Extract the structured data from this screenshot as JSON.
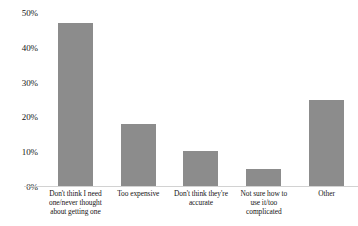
{
  "chart_data": {
    "type": "bar",
    "title": "",
    "subtitle": "",
    "xlabel": "",
    "ylabel": "",
    "categories": [
      "Don't think I need one/never thought about getting one",
      "Too expensive",
      "Don't think they're accurate",
      "Not sure how to use it/too complicated",
      "Other"
    ],
    "category_lines": [
      [
        "Don't think I need",
        "one/never thought",
        "about getting one"
      ],
      [
        "Too expensive"
      ],
      [
        "Don't think they're",
        "accurate"
      ],
      [
        "Not sure how to",
        "use it/too",
        "complicated"
      ],
      [
        "Other"
      ]
    ],
    "values": [
      47,
      18,
      10,
      5,
      25
    ],
    "value_labels": [
      "47%",
      "18%",
      "10%",
      "5%",
      "25%"
    ],
    "ylim": [
      0,
      50
    ],
    "ytick_values": [
      0,
      10,
      20,
      30,
      40,
      50
    ],
    "ytick_labels": [
      "0%",
      "10%",
      "20%",
      "30%",
      "40%",
      "50%"
    ],
    "grid": false,
    "legend": null,
    "legend_position": "none",
    "bar_color": "#8c8c8c",
    "baseline_color": "#d2d2d2",
    "background_color": "#ffffff",
    "text_color": "#151515"
  }
}
